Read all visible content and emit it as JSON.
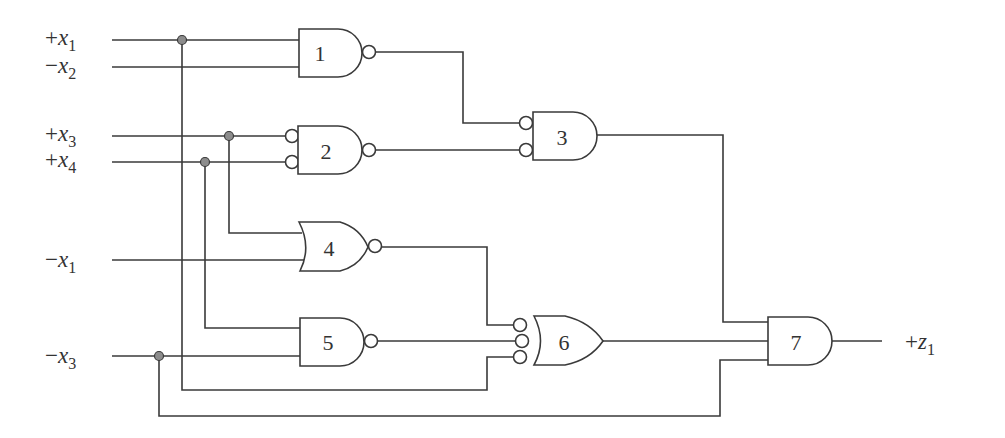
{
  "diagram": {
    "type": "logic-circuit",
    "inputs": [
      {
        "id": "in_x1p",
        "polarity": "+",
        "var": "x",
        "sub": "1"
      },
      {
        "id": "in_x2n",
        "polarity": "−",
        "var": "x",
        "sub": "2"
      },
      {
        "id": "in_x3p",
        "polarity": "+",
        "var": "x",
        "sub": "3"
      },
      {
        "id": "in_x4p",
        "polarity": "+",
        "var": "x",
        "sub": "4"
      },
      {
        "id": "in_x1n",
        "polarity": "−",
        "var": "x",
        "sub": "1"
      },
      {
        "id": "in_x3n",
        "polarity": "−",
        "var": "x",
        "sub": "3"
      }
    ],
    "output": {
      "id": "out_z1",
      "polarity": "+",
      "var": "z",
      "sub": "1"
    },
    "gates": [
      {
        "id": "1",
        "label": "1",
        "kind": "NAND",
        "inputs": [
          "+x1",
          "-x2"
        ],
        "inverted_inputs": false
      },
      {
        "id": "2",
        "label": "2",
        "kind": "AND with inverted inputs, inverted output",
        "inputs": [
          "+x3",
          "+x4"
        ],
        "inverted_inputs": true
      },
      {
        "id": "3",
        "label": "3",
        "kind": "AND with inverted inputs",
        "inputs": [
          "gate1",
          "gate2"
        ],
        "inverted_inputs": true
      },
      {
        "id": "4",
        "label": "4",
        "kind": "NOR",
        "inputs": [
          "+x3",
          "-x1"
        ],
        "inverted_inputs": false
      },
      {
        "id": "5",
        "label": "5",
        "kind": "NAND",
        "inputs": [
          "+x4",
          "-x3"
        ],
        "inverted_inputs": false
      },
      {
        "id": "6",
        "label": "6",
        "kind": "OR with inverted inputs",
        "inputs": [
          "gate4",
          "gate5",
          "+x1"
        ],
        "inverted_inputs": true
      },
      {
        "id": "7",
        "label": "7",
        "kind": "AND",
        "inputs": [
          "gate3",
          "gate6",
          "-x3"
        ],
        "inverted_inputs": false
      }
    ],
    "colors": {
      "line": "#3a3a3a",
      "junction": "#8c8c8c",
      "background": "#ffffff"
    }
  }
}
